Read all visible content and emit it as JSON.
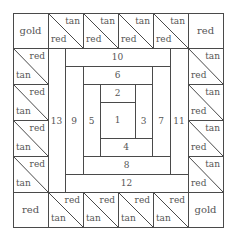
{
  "diagram": {
    "type": "quilt-block",
    "style": "log cabin center with half-square-triangle border",
    "frame": {
      "x0": 13,
      "y0": 13,
      "x1": 223,
      "y1": 227
    },
    "grid": {
      "cols": [
        13,
        48,
        83,
        118,
        153,
        188,
        223
      ],
      "rows": [
        13,
        48,
        84,
        120,
        156,
        192,
        227
      ]
    },
    "line_color": "#4a4a4a",
    "text_color": "#555555"
  },
  "corners": {
    "top_left": "gold",
    "top_right": "red",
    "bottom_left": "red",
    "bottom_right": "gold"
  },
  "border": {
    "top": [
      {
        "upper": "tan",
        "lower": "red"
      },
      {
        "upper": "tan",
        "lower": "red"
      },
      {
        "upper": "tan",
        "lower": "red"
      },
      {
        "upper": "tan",
        "lower": "red"
      }
    ],
    "bottom": [
      {
        "upper": "red",
        "lower": "tan"
      },
      {
        "upper": "red",
        "lower": "tan"
      },
      {
        "upper": "red",
        "lower": "tan"
      },
      {
        "upper": "red",
        "lower": "tan"
      }
    ],
    "left": [
      {
        "upper": "red",
        "lower": "tan"
      },
      {
        "upper": "red",
        "lower": "tan"
      },
      {
        "upper": "red",
        "lower": "tan"
      },
      {
        "upper": "red",
        "lower": "tan"
      }
    ],
    "right": [
      {
        "upper": "tan",
        "lower": "red"
      },
      {
        "upper": "tan",
        "lower": "red"
      },
      {
        "upper": "tan",
        "lower": "red"
      },
      {
        "upper": "tan",
        "lower": "red"
      }
    ]
  },
  "logs": [
    {
      "label": "1",
      "x0": 100,
      "y0": 102,
      "x1": 135,
      "y1": 138
    },
    {
      "label": "2",
      "x0": 100,
      "y0": 84,
      "x1": 135,
      "y1": 102
    },
    {
      "label": "3",
      "x0": 135,
      "y0": 84,
      "x1": 152,
      "y1": 138
    },
    {
      "label": "4",
      "x0": 100,
      "y0": 138,
      "x1": 152,
      "y1": 156
    },
    {
      "label": "5",
      "x0": 83,
      "y0": 84,
      "x1": 100,
      "y1": 156
    },
    {
      "label": "6",
      "x0": 83,
      "y0": 66,
      "x1": 152,
      "y1": 84
    },
    {
      "label": "7",
      "x0": 152,
      "y0": 66,
      "x1": 170,
      "y1": 156
    },
    {
      "label": "8",
      "x0": 83,
      "y0": 156,
      "x1": 170,
      "y1": 174
    },
    {
      "label": "9",
      "x0": 65,
      "y0": 66,
      "x1": 83,
      "y1": 174
    },
    {
      "label": "10",
      "x0": 65,
      "y0": 48,
      "x1": 170,
      "y1": 66
    },
    {
      "label": "11",
      "x0": 170,
      "y0": 48,
      "x1": 188,
      "y1": 174
    },
    {
      "label": "12",
      "x0": 65,
      "y0": 174,
      "x1": 188,
      "y1": 192
    },
    {
      "label": "13",
      "x0": 48,
      "y0": 48,
      "x1": 65,
      "y1": 192
    }
  ]
}
